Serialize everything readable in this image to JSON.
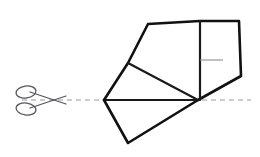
{
  "figure": {
    "canvas": {
      "width": 260,
      "height": 157,
      "background": "#ffffff"
    },
    "colors": {
      "outline": "#111111",
      "interior_fold": "#1a1a1a",
      "dashed_line": "#9a9a9a",
      "tick_mark": "#8e8e8e",
      "scissors": "#55555a"
    },
    "fold_line": {
      "name": "horizontal-fold-line",
      "style": "dashed",
      "y": 100,
      "x_start": 22,
      "x_end": 251
    },
    "tick_mark": {
      "name": "interior-tick-mark",
      "y": 60,
      "x_start": 200,
      "x_end": 223
    },
    "vertices": {
      "top_left": [
        148,
        24
      ],
      "top_mid": [
        200,
        21
      ],
      "top_right": [
        239,
        21
      ],
      "right": [
        241,
        76
      ],
      "hinge": [
        198,
        100
      ],
      "mid_left": [
        128,
        63
      ],
      "fold_left": [
        104,
        100
      ],
      "bottom": [
        128,
        143
      ]
    },
    "paths": {
      "upper_outline": "M 104 100 L 128 63 L 148 24 L 200 21 L 239 21 L 241 76 L 198 100",
      "vertical_crease": "M 200 21 L 200 100",
      "fold_crease_upper": "M 128 63 L 198 100",
      "fold_baseline": "M 104 100 L 198 100",
      "lower_flap": "M 104 100 L 128 143 L 198 100"
    },
    "scissors": {
      "name": "scissors-icon",
      "center": [
        38,
        100
      ],
      "blade_upper": "M 30 92 L 66 104",
      "blade_lower": "M 30 108 L 66 96",
      "ring_upper": {
        "cx": 26,
        "cy": 92,
        "rx": 10,
        "ry": 6,
        "rotate": -8
      },
      "ring_lower": {
        "cx": 26,
        "cy": 109,
        "rx": 10,
        "ry": 6,
        "rotate": 8
      }
    }
  }
}
